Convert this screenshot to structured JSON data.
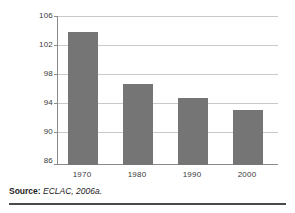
{
  "chart_data": {
    "type": "bar",
    "title": "",
    "subtitle": "",
    "xlabel": "",
    "ylabel": "Men per 100 women",
    "categories": [
      "1970",
      "1980",
      "1990",
      "2000"
    ],
    "values": [
      104,
      97,
      95,
      93.4
    ],
    "ylim": [
      86,
      106
    ],
    "yticks": [
      86,
      90,
      94,
      98,
      102,
      106
    ],
    "ytick_labels": [
      "86",
      "90",
      "94",
      "98",
      "102",
      "106"
    ],
    "grid": "horizontal",
    "legend": "none",
    "series": [
      {
        "name": "Men per 100 women",
        "values": [
          104,
          97,
          95,
          93.4
        ],
        "color": "#757575"
      }
    ],
    "annotations": []
  },
  "source": {
    "label": "Source:",
    "text": "ECLAC, 2006a."
  },
  "colors": {
    "bar_fill": "#757575",
    "gridline": "#c9c9c9",
    "axis": "#8a8a8a",
    "text": "#3a3a3a",
    "rule": "#4a4a4a",
    "background": "#ffffff"
  }
}
